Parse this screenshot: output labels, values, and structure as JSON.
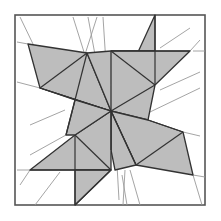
{
  "diagram": {
    "title": "",
    "colors": {
      "fill": "#bdbdbd",
      "stroke": "#333333",
      "guide": "#9a9a9a",
      "frame": "#555555",
      "background": "#ffffff"
    },
    "frame": {
      "x": 15,
      "y": 15,
      "w": 190,
      "h": 190
    },
    "center": [
      111,
      111
    ],
    "pieces": [
      {
        "name": "top-left-kite",
        "points": [
          [
            28,
            44
          ],
          [
            87,
            53
          ],
          [
            111,
            111
          ],
          [
            40,
            88
          ]
        ]
      },
      {
        "name": "top-center-wedge",
        "points": [
          [
            87,
            53
          ],
          [
            111,
            111
          ],
          [
            75,
            100
          ]
        ]
      },
      {
        "name": "top-right-triangle",
        "points": [
          [
            155,
            15
          ],
          [
            155,
            51
          ],
          [
            111,
            51
          ]
        ]
      },
      {
        "name": "top-right-upper",
        "points": [
          [
            111,
            51
          ],
          [
            155,
            51
          ],
          [
            155,
            85
          ],
          [
            111,
            111
          ]
        ]
      },
      {
        "name": "right-top-kite",
        "points": [
          [
            155,
            51
          ],
          [
            190,
            51
          ],
          [
            155,
            85
          ]
        ]
      },
      {
        "name": "right-wedge",
        "points": [
          [
            155,
            85
          ],
          [
            148,
            120
          ],
          [
            111,
            111
          ]
        ]
      },
      {
        "name": "right-lower-kite",
        "points": [
          [
            148,
            120
          ],
          [
            183,
            132
          ],
          [
            193,
            175
          ],
          [
            136,
            165
          ],
          [
            111,
            111
          ]
        ]
      },
      {
        "name": "bottom-center-wedge",
        "points": [
          [
            111,
            111
          ],
          [
            136,
            165
          ],
          [
            115,
            170
          ]
        ]
      },
      {
        "name": "bottom-left-kite",
        "points": [
          [
            111,
            111
          ],
          [
            75,
            135
          ],
          [
            30,
            170
          ],
          [
            75,
            170
          ]
        ]
      },
      {
        "name": "bottom-left-lower",
        "points": [
          [
            75,
            170
          ],
          [
            111,
            170
          ],
          [
            75,
            207
          ]
        ]
      },
      {
        "name": "left-wedge",
        "points": [
          [
            75,
            100
          ],
          [
            111,
            111
          ],
          [
            66,
            135
          ]
        ]
      }
    ]
  }
}
